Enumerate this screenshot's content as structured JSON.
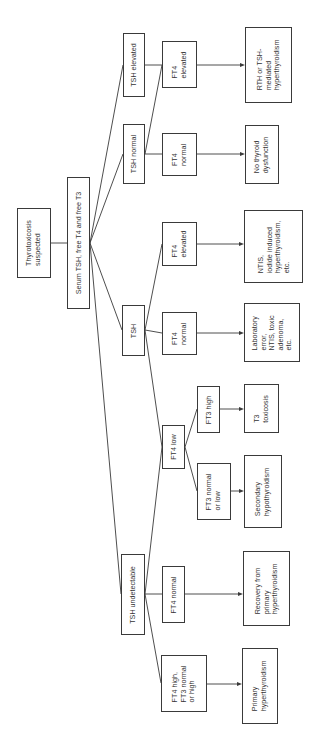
{
  "diagram": {
    "title": "Thyrotoxicosis suspected",
    "orientation": "rotated-90-ccw",
    "colors": {
      "stroke": "#3a3a3a",
      "text": "#333333",
      "background": "#ffffff"
    },
    "nodes": {
      "root": {
        "text": "Thyrotoxicosis\nsuspected"
      },
      "test": {
        "text": "Serum TSH, free T4 and free T3"
      },
      "tsh_elevated": {
        "text": "TSH elevated"
      },
      "tsh_normal": {
        "text": "TSH normal"
      },
      "tsh": {
        "text": "TSH"
      },
      "tsh_undetectable": {
        "text": "TSH undetectable"
      },
      "ft4_elevated_a": {
        "text": "FT4\nelevated"
      },
      "ft4_normal_a": {
        "text": "FT4\nnormal"
      },
      "ft4_elevated_b": {
        "text": "FT4\nelevated"
      },
      "ft4_normal_b": {
        "text": "FT4\nnormal"
      },
      "ft4_low": {
        "text": "FT4 low"
      },
      "ft3_high": {
        "text": "FT3 high"
      },
      "ft3_normal_low": {
        "text": "FT3 normal\nor low"
      },
      "ft4_normal_c": {
        "text": "FT4 normal"
      },
      "ft4_high": {
        "text": "FT4 high,\nFT3 normal\nor high"
      },
      "out_rth": {
        "text": "RTH or TSH-\nmediated\nhyperthyroidism"
      },
      "out_no_dysfunction": {
        "text": "No thyroid\ndysfunction"
      },
      "out_ntis": {
        "text": "NTIS,\niodide induced\nhyperthyroidism,\netc."
      },
      "out_lab_error": {
        "text": "Laboratory\nerror,\nNTIS, toxic\nadenoma,\netc."
      },
      "out_t3_toxicosis": {
        "text": "T3\ntoxicosis"
      },
      "out_secondary": {
        "text": "Secondary\nhypothyroidism"
      },
      "out_recovery": {
        "text": "Recovery from\nprimary\nhyperthyroidism"
      },
      "out_primary": {
        "text": "Primary\nhyperthyroidism"
      }
    },
    "edges": [
      [
        "root",
        "test"
      ],
      [
        "test",
        "tsh_elevated"
      ],
      [
        "test",
        "tsh_normal"
      ],
      [
        "test",
        "tsh"
      ],
      [
        "test",
        "tsh_undetectable"
      ],
      [
        "tsh_elevated",
        "ft4_elevated_a"
      ],
      [
        "tsh_normal",
        "ft4_elevated_a"
      ],
      [
        "tsh_normal",
        "ft4_normal_a"
      ],
      [
        "tsh",
        "ft4_elevated_b"
      ],
      [
        "tsh",
        "ft4_normal_b"
      ],
      [
        "tsh",
        "ft4_low"
      ],
      [
        "ft4_low",
        "ft3_high"
      ],
      [
        "ft4_low",
        "ft3_normal_low"
      ],
      [
        "tsh_undetectable",
        "ft4_low"
      ],
      [
        "tsh_undetectable",
        "ft4_normal_c"
      ],
      [
        "tsh_undetectable",
        "ft4_high"
      ],
      [
        "ft4_elevated_a",
        "out_rth"
      ],
      [
        "ft4_normal_a",
        "out_no_dysfunction"
      ],
      [
        "ft4_elevated_b",
        "out_ntis"
      ],
      [
        "ft4_normal_b",
        "out_lab_error"
      ],
      [
        "ft3_high",
        "out_t3_toxicosis"
      ],
      [
        "ft3_normal_low",
        "out_secondary"
      ],
      [
        "ft4_normal_c",
        "out_recovery"
      ],
      [
        "ft4_high",
        "out_primary"
      ]
    ]
  }
}
